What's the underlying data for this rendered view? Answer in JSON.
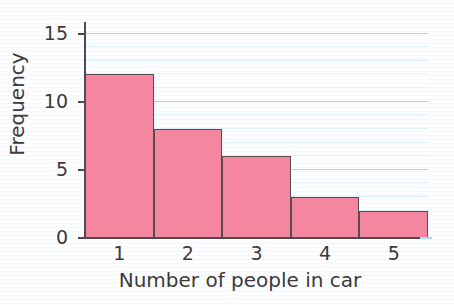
{
  "chart_data": {
    "type": "bar",
    "title": "",
    "xlabel": "Number of people in car",
    "ylabel": "Frequency",
    "categories": [
      "1",
      "2",
      "3",
      "4",
      "5"
    ],
    "values": [
      12,
      8,
      6,
      3,
      2
    ],
    "ylim": [
      0,
      15.7
    ],
    "ytick_labels": [
      "0",
      "5",
      "10",
      "15"
    ],
    "ytick_values": [
      0,
      5,
      10,
      15
    ],
    "grid": "horizontal",
    "grid_minor_step": 1,
    "legend": "none",
    "bar_fill_color": "#f4869f",
    "bar_edge_color": "#584c4e",
    "axis_color": "#4e4a4d",
    "grid_major_color": "#8fdde8",
    "grid_minor_color": "#dff3f7",
    "background_color": "#fdfeff",
    "text_color": "#3d3a3c"
  }
}
